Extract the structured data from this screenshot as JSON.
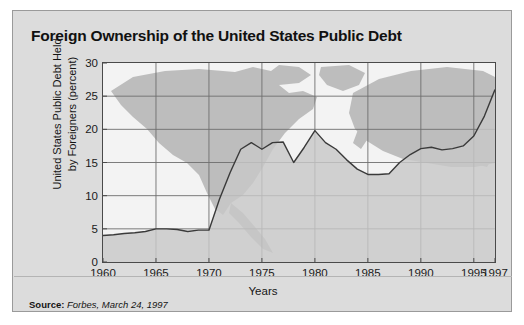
{
  "figure": {
    "title": "Foreign Ownership of the United States Public Debt",
    "source_label": "Source:",
    "source_text": "Forbes, March 24, 1997",
    "background_color": "#dcdcdc",
    "plot_background_color": "#f3f3f3",
    "line_color": "#3a3a3a",
    "fill_color": "#c8c8c8",
    "map_color": "#bdbdbd"
  },
  "chart_data": {
    "type": "area",
    "title": "Foreign Ownership of the United States Public Debt",
    "xlabel": "Years",
    "ylabel": "United States Public Debt  Held by Foreigners (percent)",
    "ylabel_line1": "United States Public Debt  Held",
    "ylabel_line2": "by Foreigners (percent)",
    "xlim": [
      1960,
      1997
    ],
    "ylim": [
      0,
      30
    ],
    "yticks": [
      0,
      5,
      10,
      15,
      20,
      25,
      30
    ],
    "ytick_labels": [
      "0",
      "5",
      "10",
      "15",
      "20",
      "25",
      "30"
    ],
    "xticks": [
      1960,
      1965,
      1970,
      1975,
      1980,
      1985,
      1990,
      1995,
      1997
    ],
    "xtick_labels": [
      "1960",
      "1965",
      "1970",
      "1975",
      "1980",
      "1985",
      "1990",
      "1995",
      "1997"
    ],
    "grid": true,
    "grid_x": [
      1965,
      1970,
      1975,
      1980,
      1985,
      1990,
      1995
    ],
    "grid_y": [
      5,
      10,
      15,
      20,
      25
    ],
    "legend": null,
    "series": [
      {
        "name": "United States Public Debt Held by Foreigners",
        "x": [
          1960,
          1961,
          1962,
          1963,
          1964,
          1965,
          1966,
          1967,
          1968,
          1969,
          1970,
          1971,
          1972,
          1973,
          1974,
          1975,
          1976,
          1977,
          1978,
          1979,
          1980,
          1981,
          1982,
          1983,
          1984,
          1985,
          1986,
          1987,
          1988,
          1989,
          1990,
          1991,
          1992,
          1993,
          1994,
          1995,
          1996,
          1997
        ],
        "values": [
          4.0,
          4.1,
          4.3,
          4.4,
          4.6,
          5.0,
          5.0,
          4.9,
          4.6,
          4.8,
          4.8,
          9.5,
          13.5,
          17.0,
          18.0,
          17.0,
          18.0,
          18.1,
          15.0,
          17.3,
          19.8,
          18.0,
          17.0,
          15.4,
          14.0,
          13.2,
          13.2,
          13.3,
          15.0,
          16.2,
          17.1,
          17.3,
          16.9,
          17.1,
          17.5,
          19.0,
          22.0,
          26.0
        ]
      }
    ]
  }
}
